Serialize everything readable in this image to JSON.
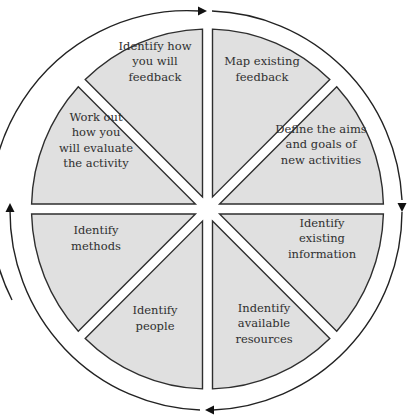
{
  "diagram": {
    "type": "cycle-wheel",
    "direction": "clockwise",
    "segment_fill": "#e0e0e0",
    "segment_stroke": "#2e2e2e",
    "segments": [
      {
        "id": "map-existing-feedback",
        "lines": [
          "Map existing",
          "feedback"
        ]
      },
      {
        "id": "define-aims-goals",
        "lines": [
          "Define the aims",
          "and goals of",
          "new activities"
        ]
      },
      {
        "id": "identify-existing-information",
        "lines": [
          "Identify",
          "existing",
          "information"
        ]
      },
      {
        "id": "indentify-available-resources",
        "lines": [
          "Indentify",
          "available",
          "resources"
        ]
      },
      {
        "id": "identify-people",
        "lines": [
          "Identify",
          "people"
        ]
      },
      {
        "id": "identify-methods",
        "lines": [
          "Identify",
          "methods"
        ]
      },
      {
        "id": "work-out-evaluate",
        "lines": [
          "Work out",
          "how you",
          "will evaluate",
          "the activity"
        ]
      },
      {
        "id": "identify-feedback",
        "lines": [
          "Identify how",
          "you will",
          "feedback"
        ]
      }
    ],
    "arrows": [
      {
        "position": "top",
        "points": "right"
      },
      {
        "position": "right",
        "points": "down"
      },
      {
        "position": "bottom",
        "points": "left"
      },
      {
        "position": "left",
        "points": "up"
      }
    ]
  }
}
